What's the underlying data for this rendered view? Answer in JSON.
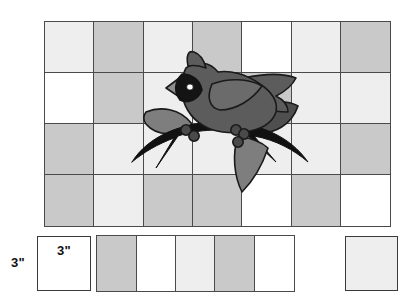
{
  "palette": {
    "patch_white": "#ffffff",
    "patch_light": "#eeeeee",
    "patch_medium": "#c9c9c9",
    "grid_line": "#4a4a4a",
    "bird_body": "#5c5c5c",
    "bird_wing": "#6b6b6b",
    "bird_dark_leaf": "#4f4f4f",
    "bird_light_leaf": "#7e7e7e",
    "beak": "#8d8d8d",
    "branch": "#111111",
    "outline": "#1a1a1a",
    "text": "#111111"
  },
  "labels": {
    "square_size_top": "3\"",
    "square_size_side": "3\""
  },
  "grid": {
    "rows": 4,
    "columns": 7,
    "patch_tones": [
      [
        "light",
        "medium",
        "light",
        "medium",
        "white",
        "light",
        "medium"
      ],
      [
        "white",
        "medium",
        "light",
        "light",
        "medium",
        "light",
        "light"
      ],
      [
        "medium",
        "light",
        "light",
        "light",
        "light",
        "light",
        "medium"
      ],
      [
        "medium",
        "light",
        "medium",
        "medium",
        "white",
        "medium",
        "white"
      ]
    ]
  },
  "bottom_strip": {
    "patch_tones": [
      "medium",
      "white",
      "light",
      "medium",
      "white"
    ]
  },
  "standalone": {
    "sample_square_tone": "white",
    "corner_square_tone": "light"
  },
  "applique": {
    "name": "cardinal-on-branch",
    "parts": [
      "branch",
      "bird-body",
      "bird-head",
      "bird-crest",
      "bird-beak",
      "bird-eye",
      "bird-wing",
      "bird-tail",
      "leaf-left",
      "leaf-right-upper",
      "leaf-right-lower",
      "berries"
    ]
  }
}
